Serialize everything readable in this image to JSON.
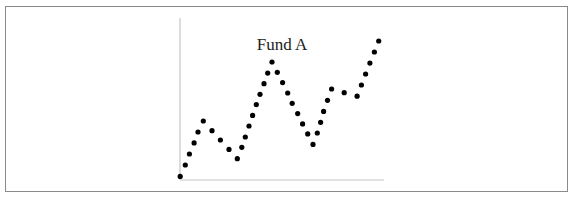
{
  "chart_data": {
    "type": "scatter",
    "title": "Fund A",
    "xlabel": "",
    "ylabel": "",
    "xlim": [
      0,
      100
    ],
    "ylim": [
      0,
      100
    ],
    "grid": false,
    "legend": null,
    "marker_color": "#000000",
    "axis_color": "#c4c4c4",
    "series": [
      {
        "name": "Fund A",
        "x": [
          0.1,
          2.6,
          4.6,
          6.9,
          8.8,
          11.4,
          15.7,
          19.8,
          24.0,
          28.1,
          30.3,
          32.0,
          33.8,
          35.6,
          37.4,
          39.2,
          41.2,
          43.0,
          45.1,
          47.7,
          50.3,
          52.8,
          55.0,
          57.7,
          60.1,
          62.6,
          65.2,
          67.3,
          68.9,
          70.4,
          72.3,
          74.3,
          80.5,
          86.8,
          88.9,
          91.0,
          93.1,
          95.3,
          97.4
        ],
        "y": [
          1.6,
          8.7,
          15.5,
          22.4,
          29.2,
          36.0,
          30.0,
          24.2,
          18.4,
          12.6,
          19.7,
          26.1,
          32.9,
          39.5,
          46.2,
          52.6,
          59.2,
          65.8,
          72.7,
          66.3,
          59.9,
          53.4,
          47.0,
          40.6,
          34.2,
          28.0,
          21.5,
          28.6,
          35.2,
          42.0,
          48.9,
          55.9,
          53.6,
          51.4,
          58.4,
          65.2,
          72.0,
          78.9,
          85.7
        ]
      }
    ]
  }
}
